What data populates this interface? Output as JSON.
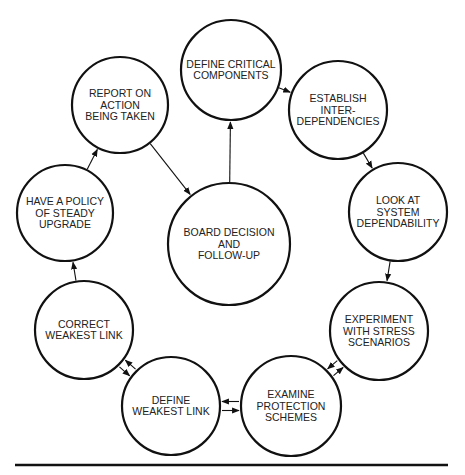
{
  "diagram": {
    "title": "",
    "colors": {
      "stroke": "#111111",
      "text": "#222222",
      "background": "#ffffff"
    },
    "nodes": [
      {
        "id": "define-critical-components",
        "cx": 231,
        "cy": 70,
        "r": 50,
        "lines": [
          "DEFINE CRITICAL",
          "COMPONENTS"
        ]
      },
      {
        "id": "establish-interdependencies",
        "cx": 338,
        "cy": 110,
        "r": 49,
        "lines": [
          "ESTABLISH",
          "INTER-",
          "DEPENDENCIES"
        ]
      },
      {
        "id": "look-at-system-dependability",
        "cx": 398,
        "cy": 212,
        "r": 49,
        "lines": [
          "LOOK AT",
          "SYSTEM",
          "DEPENDABILITY"
        ]
      },
      {
        "id": "experiment-with-stress-scenarios",
        "cx": 379,
        "cy": 331,
        "r": 49,
        "lines": [
          "EXPERIMENT",
          "WITH STRESS",
          "SCENARIOS"
        ]
      },
      {
        "id": "examine-protection-schemes",
        "cx": 291,
        "cy": 406,
        "r": 50,
        "lines": [
          "EXAMINE",
          "PROTECTION",
          "SCHEMES"
        ]
      },
      {
        "id": "define-weakest-link",
        "cx": 171,
        "cy": 406,
        "r": 49,
        "lines": [
          "DEFINE",
          "WEAKEST LINK"
        ]
      },
      {
        "id": "correct-weakest-link",
        "cx": 84,
        "cy": 330,
        "r": 49,
        "lines": [
          "CORRECT",
          "WEAKEST LINK"
        ]
      },
      {
        "id": "have-a-policy-of-steady-upgrade",
        "cx": 65,
        "cy": 213,
        "r": 48,
        "lines": [
          "HAVE A POLICY",
          "OF STEADY",
          "UPGRADE"
        ]
      },
      {
        "id": "report-on-action-being-taken",
        "cx": 120,
        "cy": 105,
        "r": 48,
        "lines": [
          "REPORT ON",
          "ACTION",
          "BEING TAKEN"
        ]
      },
      {
        "id": "board-decision-and-follow-up",
        "cx": 229,
        "cy": 244,
        "r": 61,
        "lines": [
          "BOARD DECISION",
          "AND",
          "FOLLOW-UP"
        ]
      }
    ],
    "edges": [
      {
        "from": "define-critical-components",
        "to": "establish-interdependencies"
      },
      {
        "from": "establish-interdependencies",
        "to": "look-at-system-dependability"
      },
      {
        "from": "look-at-system-dependability",
        "to": "experiment-with-stress-scenarios"
      },
      {
        "from": "experiment-with-stress-scenarios",
        "to": "examine-protection-schemes",
        "bidirectional": true
      },
      {
        "from": "examine-protection-schemes",
        "to": "define-weakest-link",
        "bidirectional": true
      },
      {
        "from": "define-weakest-link",
        "to": "correct-weakest-link",
        "bidirectional": true
      },
      {
        "from": "correct-weakest-link",
        "to": "have-a-policy-of-steady-upgrade"
      },
      {
        "from": "have-a-policy-of-steady-upgrade",
        "to": "report-on-action-being-taken"
      },
      {
        "from": "report-on-action-being-taken",
        "to": "board-decision-and-follow-up"
      },
      {
        "from": "board-decision-and-follow-up",
        "to": "define-critical-components"
      }
    ],
    "bottom_rule": {
      "x1": 15,
      "x2": 448,
      "y": 465
    }
  }
}
